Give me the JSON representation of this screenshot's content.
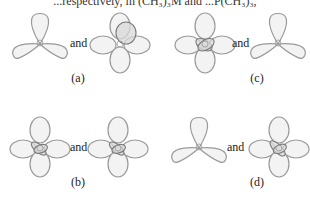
{
  "caption_top": "...respectively, in (CH₃)₃M and ...P(CH₃)₃,",
  "connector_word": "and",
  "panels": [
    {
      "id": "a",
      "label": "(a)",
      "left_orbital": "trefoil-3-lobe",
      "right_orbital": "four-lobe-with-p-lobe"
    },
    {
      "id": "c",
      "label": "(c)",
      "left_orbital": "four-lobe-with-dark-core",
      "right_orbital": "trefoil-3-lobe"
    },
    {
      "id": "b",
      "label": "(b)",
      "left_orbital": "four-lobe-with-dark-core",
      "right_orbital": "four-lobe-with-dark-core"
    },
    {
      "id": "d",
      "label": "(d)",
      "left_orbital": "trefoil-3-lobe",
      "right_orbital": "four-lobe-with-dark-core"
    }
  ],
  "colors": {
    "lobe_fill": "#f3f3f3",
    "lobe_stroke": "#9a9a9a",
    "dark_lobe_fill": "#d8d8d8"
  }
}
